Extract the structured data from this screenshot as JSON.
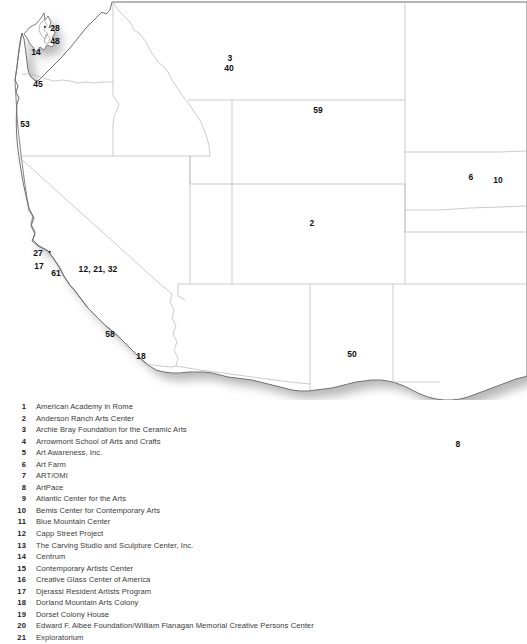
{
  "map": {
    "title": "Western United States artist residency locations map",
    "style": {
      "state_border_color": "#b9b9b9",
      "outline_color": "#6e6e6e",
      "fill_color": "#ffffff",
      "shadow_color": "#c8c8c8",
      "label_color": "#111111"
    },
    "labels": [
      {
        "id": "wa-28",
        "text": "28",
        "x": 55,
        "y": 28
      },
      {
        "id": "wa-48",
        "text": "48",
        "x": 55,
        "y": 41
      },
      {
        "id": "wa-14",
        "text": "14",
        "x": 36,
        "y": 52
      },
      {
        "id": "or-45",
        "text": "45",
        "x": 38,
        "y": 84
      },
      {
        "id": "or-53",
        "text": "53",
        "x": 25,
        "y": 124
      },
      {
        "id": "mt-3",
        "text": "3",
        "x": 230,
        "y": 58
      },
      {
        "id": "mt-40",
        "text": "40",
        "x": 229,
        "y": 68
      },
      {
        "id": "nd-59",
        "text": "59",
        "x": 318,
        "y": 110
      },
      {
        "id": "ne-6",
        "text": "6",
        "x": 471,
        "y": 177
      },
      {
        "id": "ia-10",
        "text": "10",
        "x": 498,
        "y": 180
      },
      {
        "id": "co-2",
        "text": "2",
        "x": 312,
        "y": 223
      },
      {
        "id": "ca-27",
        "text": "27",
        "x": 38,
        "y": 253
      },
      {
        "id": "ca-17",
        "text": "17",
        "x": 39,
        "y": 266
      },
      {
        "id": "ca-61",
        "text": "61",
        "x": 56,
        "y": 273
      },
      {
        "id": "ca-12-21-32",
        "text": "12, 21, 32",
        "x": 98,
        "y": 269
      },
      {
        "id": "ca-58",
        "text": "58",
        "x": 110,
        "y": 334
      },
      {
        "id": "ca-18",
        "text": "18",
        "x": 141,
        "y": 356
      },
      {
        "id": "nm-50",
        "text": "50",
        "x": 352,
        "y": 354
      },
      {
        "id": "tx-8",
        "text": "8",
        "x": 458,
        "y": 444
      }
    ],
    "dots": [
      {
        "id": "dot-sf",
        "x": 50,
        "y": 252
      },
      {
        "id": "dot-wa",
        "x": 45,
        "y": 27
      }
    ]
  },
  "legend": {
    "items": [
      {
        "num": "1",
        "name": "American Academy in Rome"
      },
      {
        "num": "2",
        "name": "Anderson Ranch Arts Center"
      },
      {
        "num": "3",
        "name": "Archie Bray Foundation for the Ceramic Arts"
      },
      {
        "num": "4",
        "name": "Arrowmont School of Arts and Crafts"
      },
      {
        "num": "5",
        "name": "Art Awareness, Inc."
      },
      {
        "num": "6",
        "name": "Art Farm"
      },
      {
        "num": "7",
        "name": "ART/OMI"
      },
      {
        "num": "8",
        "name": "ArtPace"
      },
      {
        "num": "9",
        "name": "Atlantic Center for the Arts"
      },
      {
        "num": "10",
        "name": "Bemis Center for Contemporary Arts"
      },
      {
        "num": "11",
        "name": "Blue Mountain Center"
      },
      {
        "num": "12",
        "name": "Capp Street Project"
      },
      {
        "num": "13",
        "name": "The Carving Studio and Sculpture Center, Inc."
      },
      {
        "num": "14",
        "name": "Centrum"
      },
      {
        "num": "15",
        "name": "Contemporary Artists Center"
      },
      {
        "num": "16",
        "name": "Creative Glass Center of America"
      },
      {
        "num": "17",
        "name": "Djerassi Resident Artists Program"
      },
      {
        "num": "18",
        "name": "Dorland Mountain Arts Colony"
      },
      {
        "num": "19",
        "name": "Dorset Colony House"
      },
      {
        "num": "20",
        "name": "Edward F. Albee Foundation/William Flanagan Memorial Creative Persons Center"
      },
      {
        "num": "21",
        "name": "Exploratorium"
      }
    ]
  }
}
